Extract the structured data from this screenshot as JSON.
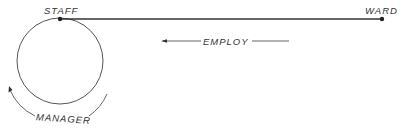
{
  "diagram": {
    "type": "entity-relationship",
    "entities": [
      {
        "id": "staff",
        "label": "STAFF"
      },
      {
        "id": "ward",
        "label": "WARD"
      }
    ],
    "relationships": [
      {
        "id": "employ",
        "label": "EMPLOY",
        "from": "ward",
        "to": "staff",
        "direction": "right-to-left"
      },
      {
        "id": "manager",
        "label": "MANAGER",
        "from": "staff",
        "to": "staff",
        "kind": "recursive"
      }
    ],
    "colors": {
      "line": "#555555",
      "node": "#222222",
      "text": "#333333"
    }
  }
}
